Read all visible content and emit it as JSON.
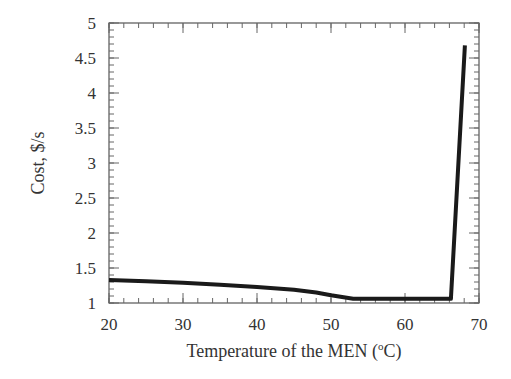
{
  "chart_data": {
    "type": "line",
    "title": "",
    "xlabel": "Temperature of the MEN (°C)",
    "xlabel_parts": {
      "pre": "Temperature of the MEN (",
      "sup": "o",
      "post": "C)"
    },
    "ylabel": "Cost,  $/s",
    "xlim": [
      20,
      70
    ],
    "ylim": [
      1,
      5
    ],
    "xticks": [
      20,
      30,
      40,
      50,
      60,
      70
    ],
    "yticks": [
      1,
      1.5,
      2,
      2.5,
      3,
      3.5,
      4,
      4.5,
      5
    ],
    "ytick_labels": [
      "1",
      "1.5",
      "2",
      "2.5",
      "3",
      "3.5",
      "4",
      "4.5",
      "5"
    ],
    "x_minor_step": 2,
    "y_minor_step": 0.1,
    "grid": false,
    "legend": null,
    "series": [
      {
        "name": "Cost",
        "color": "#1a1a1a",
        "x": [
          20,
          25,
          30,
          35,
          40,
          45,
          48,
          50,
          53,
          56,
          60,
          63,
          66.2,
          68.1
        ],
        "y": [
          1.33,
          1.31,
          1.29,
          1.26,
          1.23,
          1.19,
          1.15,
          1.11,
          1.06,
          1.06,
          1.06,
          1.06,
          1.06,
          4.68
        ]
      }
    ]
  }
}
